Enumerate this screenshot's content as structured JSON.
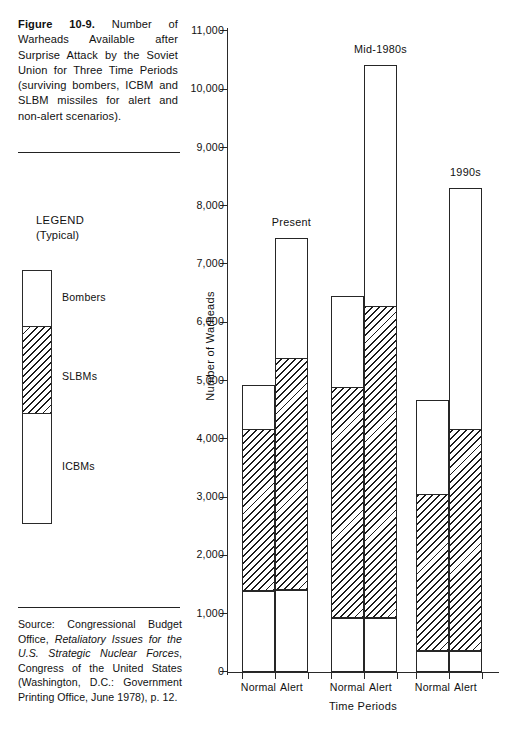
{
  "caption": {
    "figure_label": "Figure 10-9.",
    "text": " Number of Warheads Available after Surprise Attack by the Soviet Union for Three Time Periods (surviving bombers, ICBM and SLBM missiles for alert and non-alert scenarios)."
  },
  "legend": {
    "title": "LEGEND",
    "subtitle": "(Typical)",
    "items": [
      {
        "label": "Bombers",
        "fill": "white"
      },
      {
        "label": "SLBMs",
        "fill": "hatched"
      },
      {
        "label": "ICBMs",
        "fill": "white"
      }
    ]
  },
  "source": {
    "prefix": "Source: Congressional Budget Office, ",
    "italic_title": "Retaliatory Issues for the U.S. Strategic Nuclear Forces",
    "suffix": ", Congress of the United States (Washington, D.C.: Government Printing Office, June 1978), p. 12."
  },
  "chart_data": {
    "type": "bar",
    "subtype": "stacked-grouped",
    "title": "Number of Warheads Available after Surprise Attack by the Soviet Union for Three Time Periods",
    "xlabel": "Time Periods",
    "ylabel": "Number of Warheads",
    "ylim": [
      0,
      11000
    ],
    "ytick_values": [
      0,
      1000,
      2000,
      3000,
      4000,
      5000,
      6000,
      7000,
      8000,
      9000,
      10000,
      11000
    ],
    "ytick_labels": [
      "0",
      "1,000",
      "2,000",
      "3,000",
      "4,000",
      "5,000",
      "6,000",
      "7,000",
      "8,000",
      "9,000",
      "10,000",
      "11,000"
    ],
    "grid": false,
    "legend_position": "external-left",
    "series": [
      {
        "name": "ICBMs",
        "fill": "white"
      },
      {
        "name": "SLBMs",
        "fill": "hatched"
      },
      {
        "name": "Bombers",
        "fill": "white"
      }
    ],
    "groups": [
      {
        "name": "Present",
        "bars": [
          {
            "category": "Normal",
            "icbm": 1400,
            "slbm": 2780,
            "bombers": 740,
            "total": 4920,
            "cum_icbm_top": 1400,
            "cum_slbm_top": 4180,
            "cum_total": 4920
          },
          {
            "category": "Alert",
            "icbm": 1430,
            "slbm": 3970,
            "bombers": 2040,
            "total": 7440,
            "cum_icbm_top": 1430,
            "cum_slbm_top": 5400,
            "cum_total": 7440
          }
        ]
      },
      {
        "name": "Mid-1980s",
        "bars": [
          {
            "category": "Normal",
            "icbm": 950,
            "slbm": 3950,
            "bombers": 1550,
            "total": 6450,
            "cum_icbm_top": 950,
            "cum_slbm_top": 4900,
            "cum_total": 6450
          },
          {
            "category": "Alert",
            "icbm": 950,
            "slbm": 5350,
            "bombers": 4120,
            "total": 10420,
            "cum_icbm_top": 950,
            "cum_slbm_top": 6300,
            "cum_total": 10420
          }
        ]
      },
      {
        "name": "1990s",
        "bars": [
          {
            "category": "Normal",
            "icbm": 380,
            "slbm": 2700,
            "bombers": 1580,
            "total": 4660,
            "cum_icbm_top": 380,
            "cum_slbm_top": 3080,
            "cum_total": 4660
          },
          {
            "category": "Alert",
            "icbm": 380,
            "slbm": 3800,
            "bombers": 4130,
            "total": 8310,
            "cum_icbm_top": 380,
            "cum_slbm_top": 4180,
            "cum_total": 8310
          }
        ]
      }
    ]
  }
}
